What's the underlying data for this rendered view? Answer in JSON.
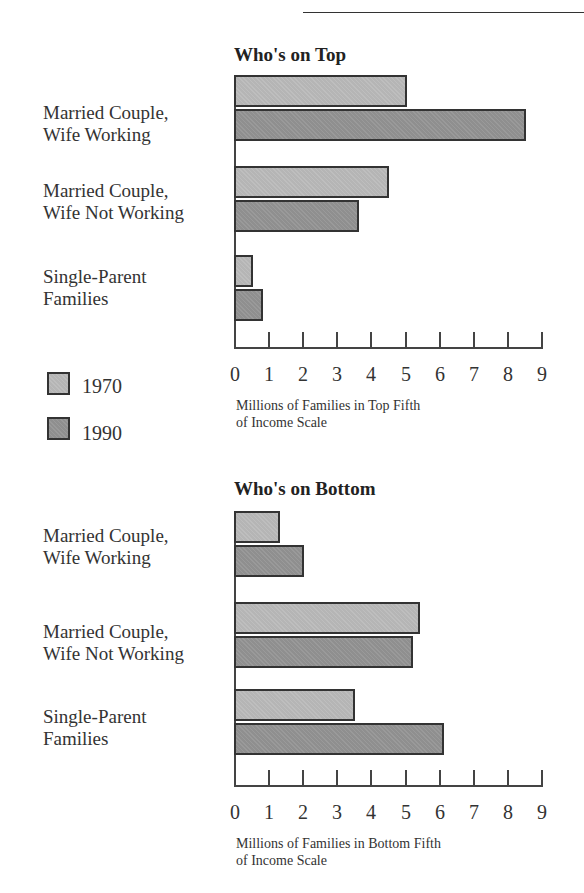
{
  "chart_data": [
    {
      "type": "bar",
      "orientation": "horizontal",
      "title": "Who's on Top",
      "categories": [
        "Married Couple, Wife Working",
        "Married Couple, Wife Not Working",
        "Single-Parent Families"
      ],
      "series": [
        {
          "name": "1970",
          "values": [
            5.0,
            4.5,
            0.5
          ]
        },
        {
          "name": "1990",
          "values": [
            8.5,
            3.6,
            0.8
          ]
        }
      ],
      "xlabel": "Millions of Families in Top Fifth of Income Scale",
      "ylabel": "",
      "xlim": [
        0,
        9
      ],
      "xticks": [
        0,
        1,
        2,
        3,
        4,
        5,
        6,
        7,
        8,
        9
      ],
      "grid": false,
      "legend_position": "left"
    },
    {
      "type": "bar",
      "orientation": "horizontal",
      "title": "Who's on Bottom",
      "categories": [
        "Married Couple, Wife Working",
        "Married Couple, Wife Not Working",
        "Single-Parent Families"
      ],
      "series": [
        {
          "name": "1970",
          "values": [
            1.3,
            5.4,
            3.5
          ]
        },
        {
          "name": "1990",
          "values": [
            2.0,
            5.2,
            6.1
          ]
        }
      ],
      "xlabel": "Millions of Families in Bottom Fifth of Income Scale",
      "ylabel": "",
      "xlim": [
        0,
        9
      ],
      "xticks": [
        0,
        1,
        2,
        3,
        4,
        5,
        6,
        7,
        8,
        9
      ],
      "grid": false,
      "legend_position": "left"
    }
  ],
  "top": {
    "title": "Who's on Top",
    "labels": [
      {
        "line1": "Married Couple,",
        "line2": "Wife Working"
      },
      {
        "line1": "Married Couple,",
        "line2": "Wife Not Working"
      },
      {
        "line1": "Single-Parent",
        "line2": "Families"
      }
    ],
    "axis_label_line1": "Millions of Families in Top Fifth",
    "axis_label_line2": "of Income Scale",
    "ticks": [
      "0",
      "1",
      "2",
      "3",
      "4",
      "5",
      "6",
      "7",
      "8",
      "9"
    ]
  },
  "bottom": {
    "title": "Who's on Bottom",
    "labels": [
      {
        "line1": "Married Couple,",
        "line2": "Wife Working"
      },
      {
        "line1": "Married Couple,",
        "line2": "Wife Not Working"
      },
      {
        "line1": "Single-Parent",
        "line2": "Families"
      }
    ],
    "axis_label_line1": "Millions of Families in Bottom Fifth",
    "axis_label_line2": "of Income Scale",
    "ticks": [
      "0",
      "1",
      "2",
      "3",
      "4",
      "5",
      "6",
      "7",
      "8",
      "9"
    ]
  },
  "legend": {
    "items": [
      {
        "label": "1970",
        "color": "#b5b5b5"
      },
      {
        "label": "1990",
        "color": "#8f8f8f"
      }
    ]
  }
}
